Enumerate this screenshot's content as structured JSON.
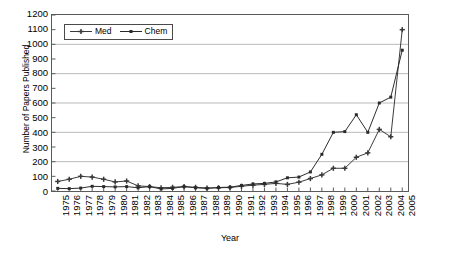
{
  "chart_data": {
    "type": "line",
    "title": "",
    "xlabel": "Year",
    "ylabel": "Number of Papers Published",
    "ylim": [
      0,
      1200
    ],
    "ytick_step": 100,
    "yticks": [
      0,
      100,
      200,
      300,
      400,
      500,
      600,
      700,
      800,
      900,
      1000,
      1100,
      1200
    ],
    "gridlines": [
      200,
      400,
      600,
      800,
      1000,
      1200
    ],
    "grid": true,
    "legend_position": "top-left inside plot",
    "categories": [
      "1975",
      "1976",
      "1977",
      "1978",
      "1979",
      "1980",
      "1981",
      "1982",
      "1983",
      "1984",
      "1985",
      "1986",
      "1987",
      "1988",
      "1989",
      "1990",
      "1991",
      "1992",
      "1993",
      "1994",
      "1995",
      "1996",
      "1997",
      "1998",
      "1999",
      "2000",
      "2001",
      "2002",
      "2003",
      "2004",
      "2005"
    ],
    "series": [
      {
        "name": "Med",
        "marker": "plus",
        "color": "#3a3a3a",
        "values": [
          65,
          80,
          100,
          95,
          80,
          62,
          68,
          35,
          30,
          22,
          25,
          30,
          25,
          20,
          22,
          24,
          32,
          40,
          45,
          52,
          45,
          60,
          85,
          110,
          155,
          155,
          230,
          260,
          420,
          370,
          1100
        ]
      },
      {
        "name": "Chem",
        "marker": "square",
        "color": "#2a2a2a",
        "values": [
          18,
          16,
          20,
          32,
          30,
          28,
          30,
          22,
          30,
          14,
          18,
          30,
          22,
          18,
          24,
          26,
          38,
          48,
          52,
          62,
          90,
          95,
          130,
          250,
          400,
          405,
          520,
          400,
          600,
          640,
          960
        ]
      }
    ]
  },
  "legend": {
    "entries": [
      {
        "label": "Med"
      },
      {
        "label": "Chem"
      }
    ]
  },
  "axes": {
    "x_title": "Year",
    "y_title": "Number of Papers Published"
  }
}
